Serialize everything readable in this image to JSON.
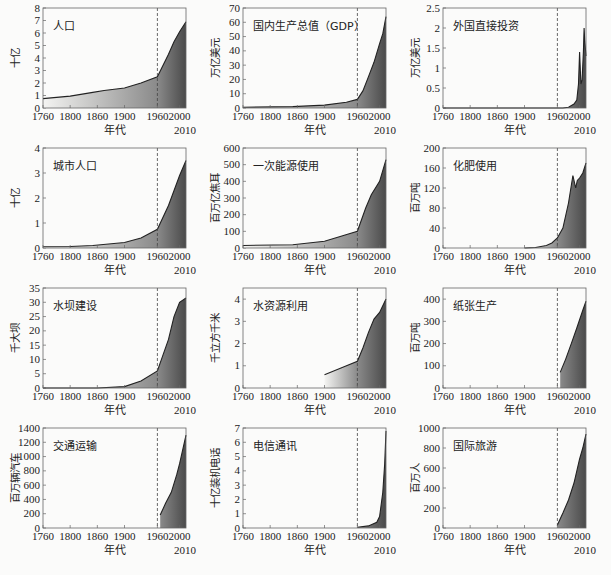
{
  "figure": {
    "xlabel": "年代",
    "x_end_label": "2010",
    "x_ticks": [
      "1760",
      "1800",
      "1860",
      "1900",
      "1960",
      "2000"
    ],
    "reference_year": 1960,
    "fill_light": "#f4f4f2",
    "fill_dark": "#4a4a4a",
    "line_color": "#222222"
  },
  "chart_data": [
    {
      "type": "area",
      "title": "人口",
      "ylabel": "十亿",
      "ylim": [
        0,
        8
      ],
      "yticks": [
        "0",
        "1",
        "2",
        "3",
        "4",
        "5",
        "6",
        "7",
        "8"
      ],
      "x": [
        1760,
        1800,
        1850,
        1870,
        1900,
        1930,
        1960,
        1980,
        1990,
        2000,
        2010
      ],
      "values": [
        0.75,
        0.95,
        1.25,
        1.4,
        1.6,
        2.0,
        2.5,
        4.3,
        5.3,
        6.1,
        6.9
      ]
    },
    {
      "type": "area",
      "title": "国内生产总值（GDP）",
      "ylabel": "万亿美元",
      "ylim": [
        0,
        70
      ],
      "yticks": [
        "0",
        "10",
        "20",
        "30",
        "40",
        "50",
        "60",
        "70"
      ],
      "x": [
        1760,
        1850,
        1900,
        1940,
        1960,
        1970,
        1980,
        1990,
        2000,
        2005,
        2010
      ],
      "values": [
        0.5,
        1,
        2,
        4,
        6,
        12,
        22,
        32,
        45,
        52,
        64
      ]
    },
    {
      "type": "area",
      "title": "外国直接投资",
      "ylabel": "万亿美元",
      "ylim": [
        0,
        2.5
      ],
      "yticks": [
        "0",
        "0.5",
        "1",
        "1.5",
        "2",
        "2.5"
      ],
      "x": [
        1760,
        1970,
        1980,
        1990,
        1995,
        1998,
        2000,
        2002,
        2004,
        2006,
        2007,
        2008,
        2010
      ],
      "values": [
        0,
        0,
        0.02,
        0.1,
        0.2,
        0.6,
        1.4,
        0.6,
        0.7,
        1.4,
        2.0,
        1.7,
        1.3
      ]
    },
    {
      "type": "area",
      "title": "城市人口",
      "ylabel": "十亿",
      "ylim": [
        0,
        4
      ],
      "yticks": [
        "0",
        "1",
        "2",
        "3",
        "4"
      ],
      "x": [
        1760,
        1800,
        1850,
        1900,
        1930,
        1960,
        1980,
        2000,
        2010
      ],
      "values": [
        0.05,
        0.06,
        0.1,
        0.22,
        0.4,
        0.75,
        1.7,
        2.9,
        3.5
      ]
    },
    {
      "type": "area",
      "title": "一次能源使用",
      "ylabel": "百万亿焦耳",
      "ylim": [
        0,
        600
      ],
      "yticks": [
        "0",
        "100",
        "200",
        "300",
        "400",
        "500",
        "600"
      ],
      "x": [
        1760,
        1850,
        1900,
        1930,
        1945,
        1960,
        1975,
        1985,
        2000,
        2010
      ],
      "values": [
        15,
        20,
        40,
        70,
        85,
        100,
        240,
        320,
        400,
        530
      ]
    },
    {
      "type": "area",
      "title": "化肥使用",
      "ylabel": "百万吨",
      "ylim": [
        0,
        200
      ],
      "yticks": [
        "0",
        "40",
        "80",
        "120",
        "160",
        "200"
      ],
      "x": [
        1900,
        1920,
        1940,
        1950,
        1960,
        1970,
        1980,
        1988,
        1993,
        1996,
        2000,
        2005,
        2010
      ],
      "values": [
        0,
        1,
        5,
        10,
        20,
        40,
        90,
        145,
        120,
        135,
        140,
        150,
        170
      ]
    },
    {
      "type": "area",
      "title": "水坝建设",
      "ylabel": "千大坝",
      "ylim": [
        0,
        35
      ],
      "yticks": [
        "0",
        "5",
        "10",
        "15",
        "20",
        "25",
        "30",
        "35"
      ],
      "x": [
        1760,
        1860,
        1900,
        1930,
        1960,
        1980,
        1990,
        2000,
        2010
      ],
      "values": [
        0,
        0,
        0.5,
        2.5,
        6,
        17,
        25,
        30,
        31.5
      ]
    },
    {
      "type": "area",
      "title": "水资源利用",
      "ylabel": "千立方千米",
      "ylim": [
        0,
        4.5
      ],
      "yticks": [
        "0",
        "1",
        "2",
        "3",
        "4"
      ],
      "x": [
        1900,
        1930,
        1960,
        1970,
        1980,
        1990,
        2000,
        2010
      ],
      "values": [
        0.6,
        0.9,
        1.2,
        1.8,
        2.5,
        3.1,
        3.4,
        4.0
      ]
    },
    {
      "type": "area",
      "title": "纸张生产",
      "ylabel": "百万吨",
      "ylim": [
        0,
        450
      ],
      "yticks": [
        "0",
        "100",
        "200",
        "300",
        "400"
      ],
      "x": [
        1965,
        1975,
        1985,
        1995,
        2005,
        2010
      ],
      "values": [
        70,
        130,
        200,
        270,
        350,
        390
      ]
    },
    {
      "type": "area",
      "title": "交通运输",
      "ylabel": "百万辆汽车",
      "ylim": [
        0,
        1400
      ],
      "yticks": [
        "0",
        "200",
        "400",
        "600",
        "800",
        "1000",
        "1200",
        "1400"
      ],
      "x": [
        1965,
        1975,
        1985,
        1995,
        2000,
        2005,
        2010
      ],
      "values": [
        180,
        350,
        500,
        750,
        900,
        1100,
        1300
      ]
    },
    {
      "type": "area",
      "title": "电信通讯",
      "ylabel": "十亿装机电话",
      "ylim": [
        0,
        7
      ],
      "yticks": [
        "0",
        "1",
        "2",
        "3",
        "4",
        "5",
        "6",
        "7"
      ],
      "x": [
        1960,
        1980,
        1995,
        2000,
        2005,
        2008,
        2010
      ],
      "values": [
        0.05,
        0.15,
        0.4,
        0.8,
        2.5,
        4.5,
        6.8
      ]
    },
    {
      "type": "area",
      "title": "国际旅游",
      "ylabel": "百万人",
      "ylim": [
        0,
        1000
      ],
      "yticks": [
        "0",
        "200",
        "400",
        "600",
        "800",
        "1000"
      ],
      "x": [
        1960,
        1970,
        1980,
        1990,
        2000,
        2005,
        2010
      ],
      "values": [
        30,
        150,
        280,
        450,
        690,
        800,
        940
      ]
    }
  ]
}
